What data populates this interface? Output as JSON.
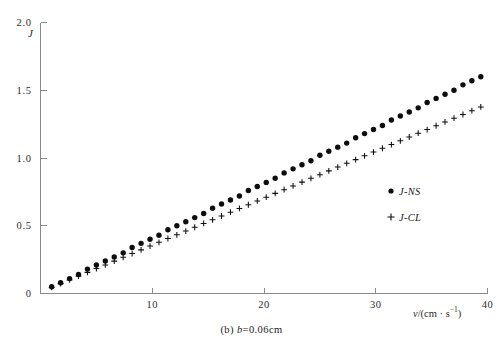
{
  "figure": {
    "caption_prefix": "(b)",
    "caption_body": "b",
    "caption_value": "=0.06cm"
  },
  "axes": {
    "y_label": "J",
    "x_label_prefix": "v",
    "x_label_body": "/(cm",
    "x_label_dot": "·",
    "x_label_unit": "s",
    "x_label_exp": "−1",
    "x_label_suffix": ")"
  },
  "legend": {
    "position": "inside-right",
    "entries": [
      {
        "label": "J-NS",
        "marker": "filled-circle"
      },
      {
        "label": "J-CL",
        "marker": "plus"
      }
    ]
  },
  "chart_data": {
    "type": "scatter",
    "title": "",
    "subtitle": "",
    "xlabel": "v/(cm · s⁻¹)",
    "ylabel": "J",
    "xlim": [
      0,
      40
    ],
    "ylim": [
      0,
      2.0
    ],
    "xticks": [
      10,
      20,
      30,
      40
    ],
    "yticks": [
      0,
      0.5,
      1.0,
      1.5,
      2.0
    ],
    "ytick_labels": [
      "0",
      "0.5",
      "1.0",
      "1.5",
      "2.0"
    ],
    "xtick_labels": [
      "10",
      "20",
      "30",
      "40"
    ],
    "grid": false,
    "legend_position": "center-right",
    "annotations": [
      "(b) b=0.06cm"
    ],
    "series": [
      {
        "name": "J-NS",
        "marker": "filled-circle",
        "color": "#0d0d0d",
        "x": [
          1.0,
          1.8,
          2.6,
          3.4,
          4.2,
          5.0,
          5.8,
          6.6,
          7.4,
          8.2,
          9.0,
          9.8,
          10.6,
          11.4,
          12.2,
          13.0,
          13.8,
          14.6,
          15.4,
          16.2,
          17.0,
          17.8,
          18.6,
          19.4,
          20.2,
          21.0,
          21.8,
          22.6,
          23.4,
          24.2,
          25.0,
          25.8,
          26.6,
          27.4,
          28.2,
          29.0,
          29.8,
          30.6,
          31.4,
          32.2,
          33.0,
          33.8,
          34.6,
          35.4,
          36.2,
          37.0,
          37.8,
          38.6,
          39.4
        ],
        "y": [
          0.05,
          0.08,
          0.11,
          0.14,
          0.18,
          0.21,
          0.24,
          0.27,
          0.3,
          0.34,
          0.37,
          0.4,
          0.43,
          0.47,
          0.5,
          0.53,
          0.56,
          0.59,
          0.63,
          0.66,
          0.69,
          0.72,
          0.76,
          0.79,
          0.82,
          0.85,
          0.89,
          0.92,
          0.95,
          0.98,
          1.02,
          1.05,
          1.08,
          1.11,
          1.15,
          1.18,
          1.21,
          1.24,
          1.28,
          1.31,
          1.34,
          1.37,
          1.41,
          1.44,
          1.47,
          1.5,
          1.54,
          1.57,
          1.6
        ]
      },
      {
        "name": "J-CL",
        "marker": "plus",
        "color": "#0d0d0d",
        "x": [
          1.0,
          1.8,
          2.6,
          3.4,
          4.2,
          5.0,
          5.8,
          6.6,
          7.4,
          8.2,
          9.0,
          9.8,
          10.6,
          11.4,
          12.2,
          13.0,
          13.8,
          14.6,
          15.4,
          16.2,
          17.0,
          17.8,
          18.6,
          19.4,
          20.2,
          21.0,
          21.8,
          22.6,
          23.4,
          24.2,
          25.0,
          25.8,
          26.6,
          27.4,
          28.2,
          29.0,
          29.8,
          30.6,
          31.4,
          32.2,
          33.0,
          33.8,
          34.6,
          35.4,
          36.2,
          37.0,
          37.8,
          38.6,
          39.4
        ],
        "y": [
          0.045,
          0.073,
          0.1,
          0.128,
          0.156,
          0.184,
          0.211,
          0.239,
          0.267,
          0.295,
          0.322,
          0.35,
          0.378,
          0.406,
          0.433,
          0.461,
          0.489,
          0.517,
          0.544,
          0.572,
          0.6,
          0.628,
          0.655,
          0.683,
          0.711,
          0.739,
          0.766,
          0.794,
          0.822,
          0.85,
          0.877,
          0.905,
          0.933,
          0.961,
          0.988,
          1.016,
          1.044,
          1.072,
          1.099,
          1.127,
          1.155,
          1.183,
          1.21,
          1.238,
          1.266,
          1.294,
          1.321,
          1.349,
          1.377
        ]
      }
    ]
  }
}
